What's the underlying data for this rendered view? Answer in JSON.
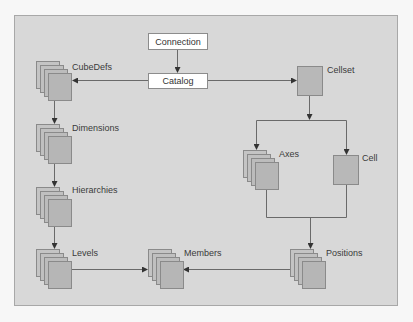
{
  "diagram": {
    "nodes": {
      "connection": {
        "label": "Connection",
        "shape": "box"
      },
      "catalog": {
        "label": "Catalog",
        "shape": "box"
      },
      "cubedefs": {
        "label": "CubeDefs",
        "shape": "collection"
      },
      "dimensions": {
        "label": "Dimensions",
        "shape": "collection"
      },
      "hierarchies": {
        "label": "Hierarchies",
        "shape": "collection"
      },
      "levels": {
        "label": "Levels",
        "shape": "collection"
      },
      "members": {
        "label": "Members",
        "shape": "collection"
      },
      "cellset": {
        "label": "Cellset",
        "shape": "single"
      },
      "axes": {
        "label": "Axes",
        "shape": "collection"
      },
      "cell": {
        "label": "Cell",
        "shape": "single"
      },
      "positions": {
        "label": "Positions",
        "shape": "collection"
      }
    },
    "edges": [
      {
        "from": "Connection",
        "to": "Catalog"
      },
      {
        "from": "Catalog",
        "to": "CubeDefs"
      },
      {
        "from": "Catalog",
        "to": "Cellset"
      },
      {
        "from": "CubeDefs",
        "to": "Dimensions"
      },
      {
        "from": "Dimensions",
        "to": "Hierarchies"
      },
      {
        "from": "Hierarchies",
        "to": "Levels"
      },
      {
        "from": "Levels",
        "to": "Members"
      },
      {
        "from": "Cellset",
        "to": "Axes"
      },
      {
        "from": "Cellset",
        "to": "Cell"
      },
      {
        "from": "Axes",
        "to": "Positions"
      },
      {
        "from": "Cell",
        "to": "Positions"
      },
      {
        "from": "Positions",
        "to": "Members"
      }
    ],
    "colors": {
      "panel": "#d8d8d8",
      "node_fill": "#b8b8b8",
      "node_border": "#8a8a8a",
      "line": "#6a6a6a",
      "box_fill": "#ffffff"
    }
  }
}
